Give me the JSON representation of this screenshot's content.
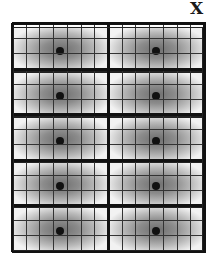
{
  "diagram": {
    "axis_label": "X",
    "main_grid": {
      "columns": 2,
      "rows": 5,
      "left": 12,
      "top": 23,
      "cell_width": 96,
      "cell_height": 45.5,
      "border_color": "#111111"
    },
    "offset_grid": {
      "columns": 2,
      "rows": 5,
      "left": 13,
      "top": 27,
      "cell_width": 96,
      "cell_height": 45,
      "right": 203,
      "bottom": 251,
      "border_color": "#222222"
    },
    "subdivision": {
      "columns": 7,
      "rows": 3
    },
    "shading": {
      "center": "#6e6e6e",
      "edge": "#f2f2f2"
    },
    "dot_color": "#111111"
  }
}
